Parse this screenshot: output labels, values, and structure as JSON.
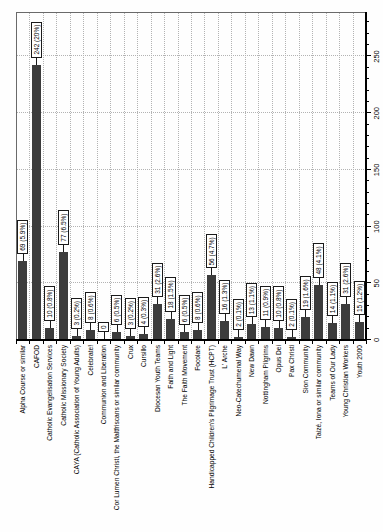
{
  "page": {
    "background": "#fefefe"
  },
  "chart_data": {
    "type": "bar",
    "orientation": "horizontal bars, whole chart rotated 90deg counter-clockwise on page",
    "title": "",
    "xlabel": "",
    "ylabel": "",
    "legend": "none",
    "grid": true,
    "bar_color": "#3c3c3c",
    "gridline_color": "#b3b3b3",
    "label_box_background": "#ffffff",
    "label_box_border": "#1a1a1a",
    "value_axis": {
      "min": 0,
      "max": 288,
      "major_tick_interval": 50,
      "minor_tick_interval": 10,
      "tick_labels": [
        "0",
        "50",
        "100",
        "150",
        "200",
        "250"
      ]
    },
    "categories": [
      "Alpha Course or similar",
      "CAFOD",
      "Catholic Evangelisation Services",
      "Catholic Missionary Society",
      "CAYA (Catholic Association of Young Adults)",
      "Celebrate!",
      "Communion and Liberation",
      "Cor Lumen Christi, the Maltfriscans or similar community",
      "Crux",
      "Cursillo",
      "Diocesan Youth Teams",
      "Faith and Light",
      "The Faith Movement",
      "Focolare",
      "Handicapped Children's Pilgrimage Trust (HCPT)",
      "L' Arche",
      "Neo-Catechumenal Way",
      "New Dawn",
      "Nottingham Pilgrims",
      "Opus Dei",
      "Pax Christi",
      "Sion Community",
      "Taizé, Iona or similar community",
      "Teams of Our Lady",
      "Young Christian Workers",
      "Youth 2000"
    ],
    "values": [
      69,
      242,
      10,
      77,
      3,
      8,
      0,
      6,
      3,
      4,
      31,
      18,
      6,
      8,
      56,
      16,
      2,
      13,
      11,
      10,
      2,
      19,
      48,
      14,
      31,
      15
    ],
    "data_labels": [
      "69 (5.9%)",
      "242 (20%)",
      "10 (0.8%)",
      "77 (6.5%)",
      "3 (0.2%)",
      "8 (0.6%)",
      "0",
      "6 (0.5%)",
      "3 (0.2%)",
      "4 (0.3%)",
      "31 (2.6%)",
      "18 (1.5%)",
      "6 (0.5%)",
      "8 (0.6%)",
      "56 (4.7%)",
      "16 (1.3%)",
      "2 (0.1%)",
      "13 (1.1%)",
      "11 (0.9%)",
      "10 (0.8%)",
      "2 (0.1%)",
      "19 (1.6%)",
      "48 (4.1%)",
      "14 (1.1%)",
      "31 (2.6%)",
      "15 (1.2%)"
    ]
  }
}
